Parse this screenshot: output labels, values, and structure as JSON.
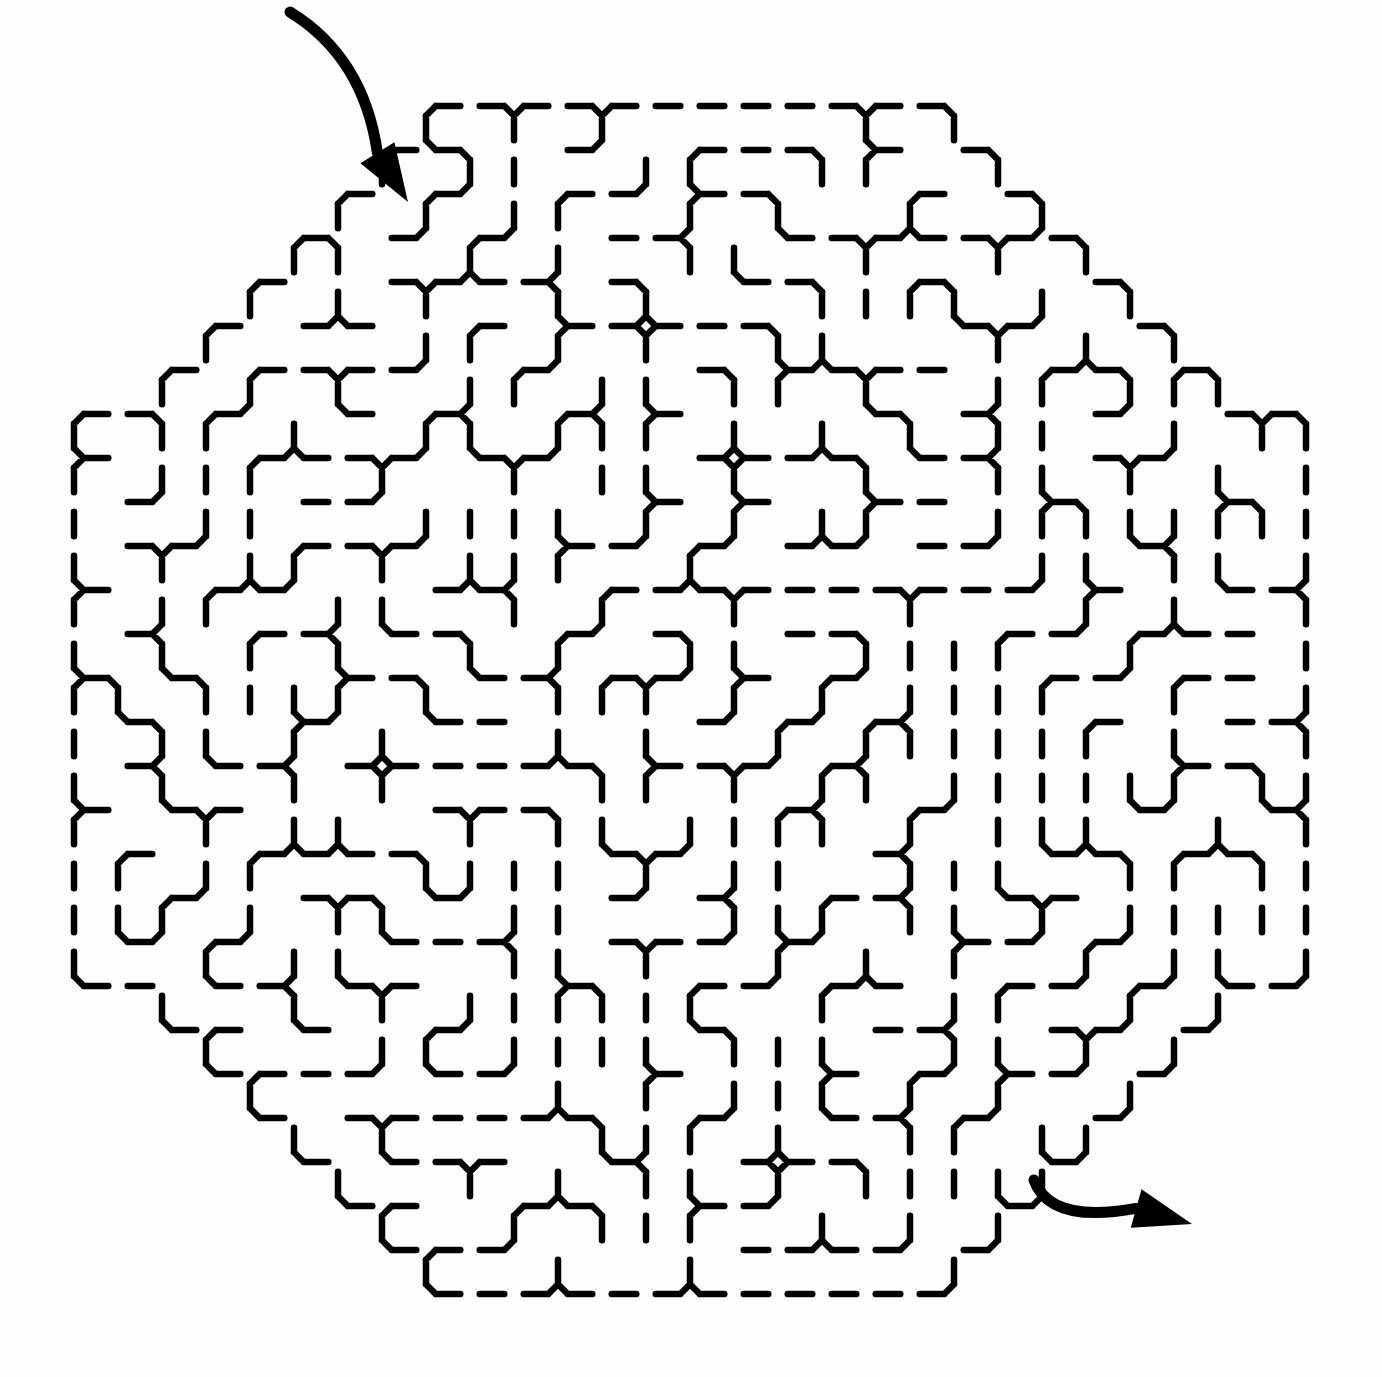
{
  "page": {
    "title": "Octagonal maze puzzle",
    "background_color": "#fdfdfd",
    "wall_color": "#000000"
  },
  "maze": {
    "center": [
      690,
      700
    ],
    "radius_x": 612,
    "radius_y": 588,
    "cell_pitch": 44,
    "wall_width": 6.5,
    "seed": 7
  },
  "entry_arrow": {
    "label": "start",
    "direction": "down-right",
    "tail": [
      290,
      12
    ],
    "tip": [
      408,
      202
    ]
  },
  "exit_arrow": {
    "label": "finish",
    "direction": "right",
    "tail": [
      1034,
      1180
    ],
    "tip": [
      1192,
      1224
    ]
  }
}
